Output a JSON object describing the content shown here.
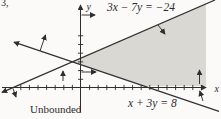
{
  "page": {
    "exercise_number": "3,",
    "region_label": "Unbounded"
  },
  "figure": {
    "axis_labels": {
      "x": "x",
      "y": "y"
    },
    "equation_labels": {
      "line1": "3x − 7y = −24",
      "line2": "x + 3y = 8"
    },
    "colors": {
      "ink": "#2e2e2e",
      "shading": "#d9d8d3",
      "background": "#fbfaf8"
    }
  },
  "chart_data": {
    "type": "line",
    "title": "",
    "xlabel": "x",
    "ylabel": "y",
    "lines": [
      {
        "label": "3x − 7y = −24",
        "slope": 0.4286,
        "x_intercept": -8,
        "y_intercept": 3.4286,
        "sample_points": [
          [
            -8,
            0
          ],
          [
            -1,
            3
          ],
          [
            6,
            6
          ]
        ]
      },
      {
        "label": "x + 3y = 8",
        "slope": -0.3333,
        "x_intercept": 8,
        "y_intercept": 2.6667,
        "sample_points": [
          [
            -4,
            4
          ],
          [
            -1,
            3
          ],
          [
            8,
            0
          ]
        ]
      }
    ],
    "intersection_point": [
      -1,
      3
    ],
    "shaded_region": {
      "label": "Unbounded",
      "description": "Gray wedge opening to the right from the intersection point, below line 3x − 7y = −24 and above line x + 3y = 8",
      "inequalities": [
        "3x − 7y ≥ −24",
        "x + 3y ≥ 8"
      ]
    },
    "axes": {
      "x_tick_min": -7,
      "x_tick_max": 14,
      "y_tick_min": 1,
      "y_tick_max": 6,
      "tick_step": 1,
      "grid": false,
      "legend": false
    }
  }
}
